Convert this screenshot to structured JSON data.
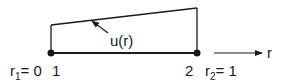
{
  "diagram": {
    "colors": {
      "line": "#1a1a1a",
      "background": "#ffffff"
    },
    "nodes": [
      {
        "id": "1",
        "label": "1",
        "coord_label": "r",
        "coord_sub": "1",
        "coord_value": "= 0"
      },
      {
        "id": "2",
        "label": "2",
        "coord_label": "r",
        "coord_sub": "2",
        "coord_value": "= 1"
      }
    ],
    "function_label": "u(r)",
    "axis_label": "r"
  }
}
